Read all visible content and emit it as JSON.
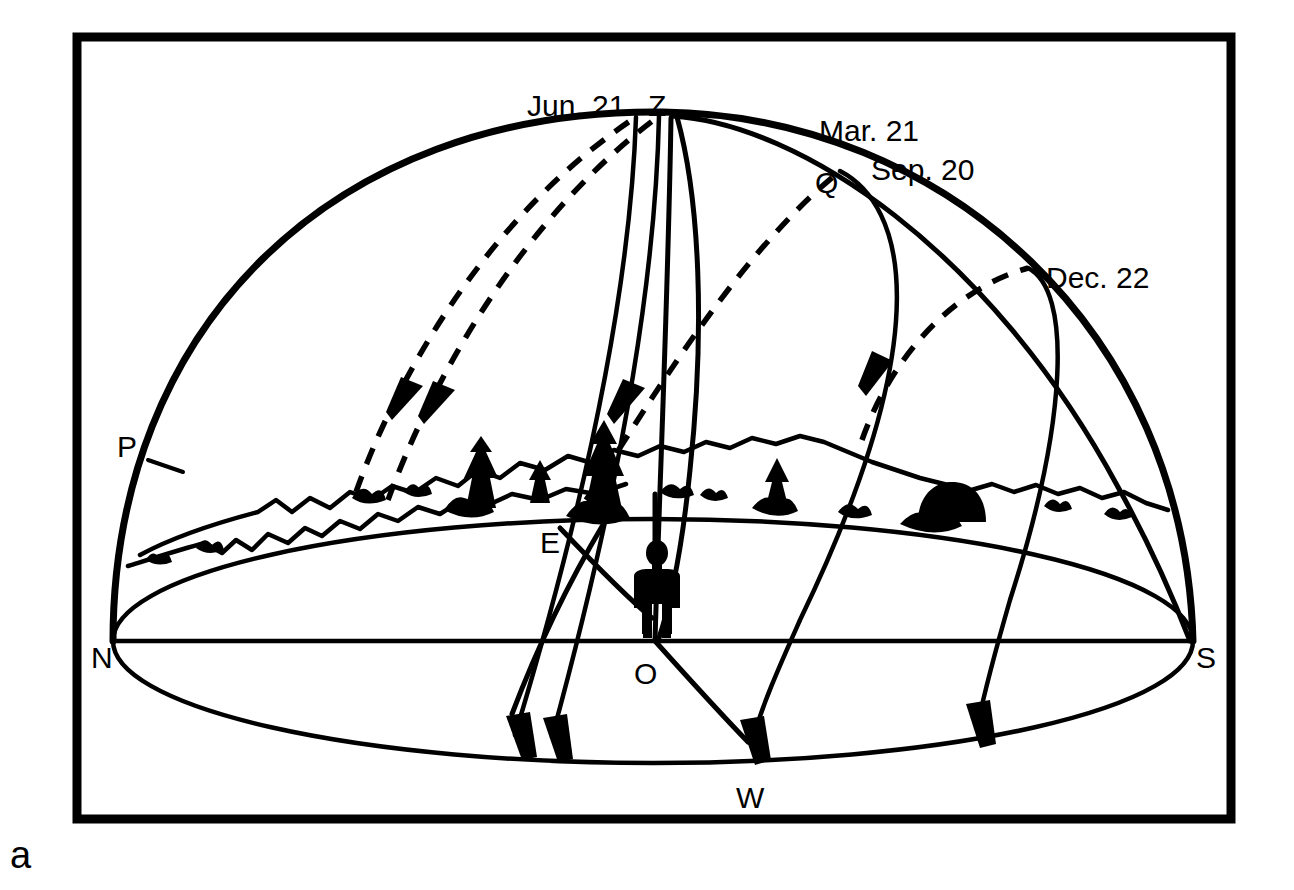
{
  "figure": {
    "caption_letter": "a",
    "type": "celestial-sphere-diagram"
  },
  "colors": {
    "ink": "#000000",
    "background": "#ffffff"
  },
  "labels": {
    "zenith": "Z",
    "north": "N",
    "south": "S",
    "east": "E",
    "west": "W",
    "observer": "O",
    "pole": "P",
    "equator_point": "Q",
    "june_solstice": "Jun. 21",
    "march_equinox": "Mar. 21",
    "september_equinox": "Sep. 20",
    "december_solstice": "Dec. 22"
  },
  "elements": {
    "dome_name": "celestial-hemisphere",
    "horizon_name": "horizon-circle",
    "observer_name": "observer-figure",
    "skyline_name": "landscape-skyline"
  },
  "paths": [
    {
      "id": "jun-21-a",
      "label": "Jun. 21",
      "style": "dashed-above-horizon",
      "note": "summer solstice, highest arc, rises north of east"
    },
    {
      "id": "jun-21-b",
      "label": "Jun. 21",
      "style": "dashed-above-horizon",
      "note": "companion solstice arc"
    },
    {
      "id": "mar-21-sep-20",
      "label": "Mar. 21 / Sep. 20",
      "style": "dashed-above-horizon",
      "note": "equinox path through Q, rises due east sets due west"
    },
    {
      "id": "dec-22",
      "label": "Dec. 22",
      "style": "dashed-above-horizon",
      "note": "winter solstice, lowest arc, rises south of east"
    }
  ]
}
